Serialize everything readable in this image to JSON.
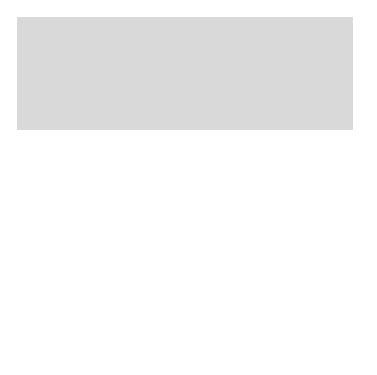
{
  "diagram": {
    "colors": {
      "background_panel": "#d8d8d8",
      "cell_body": "#8a8a8a",
      "cell_shadow": "#6e6e6e",
      "vesicle_light": "#e6e6e6",
      "arrow": "#1a1a1a",
      "text": "#3a3a3a"
    },
    "labels": {
      "lysosome": "Lysosome",
      "phagosome": "Phagosome",
      "epitopes": "Epitopes",
      "mhc_protein": "MHC protein"
    },
    "steps": [
      {
        "num": "1",
        "lines": [
          "Phagocytosis",
          "of antigen"
        ]
      },
      {
        "num": "2",
        "lines": [
          "Lysosome",
          "fuses with",
          "phagosome"
        ]
      },
      {
        "num": "3",
        "lines": [
          "Antigen and",
          "enzyme mix in",
          "phagolysosome"
        ]
      },
      {
        "num": "4",
        "lines": [
          "Antigen is",
          "degraded"
        ]
      },
      {
        "num": "5",
        "lines": [
          "Antigen",
          "residue is",
          "voided by",
          "exocytosis"
        ]
      },
      {
        "num": "6",
        "lines": [
          "Processed",
          "antigen",
          "fragments",
          "(epitopes)",
          "displayed on",
          "macrophage",
          "surface"
        ]
      }
    ]
  }
}
